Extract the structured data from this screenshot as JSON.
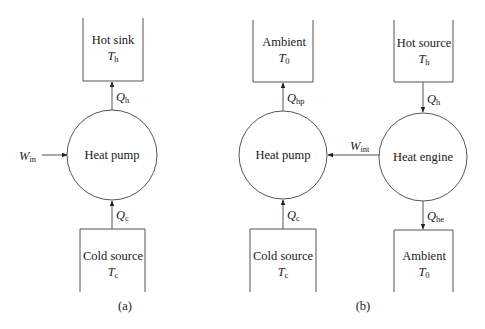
{
  "diagram_a": {
    "caption": "(a)",
    "hot_sink": {
      "name": "Hot sink",
      "temp_sym": "T",
      "temp_sub": "h"
    },
    "heat_pump": {
      "name": "Heat pump"
    },
    "cold_source": {
      "name": "Cold source",
      "temp_sym": "T",
      "temp_sub": "c"
    },
    "q_hot": {
      "sym": "Q",
      "sub": "h"
    },
    "q_cold": {
      "sym": "Q",
      "sub": "c"
    },
    "work_in": {
      "sym": "W",
      "sub": "in"
    }
  },
  "diagram_b": {
    "caption": "(b)",
    "ambient_top": {
      "name": "Ambient",
      "temp_sym": "T",
      "temp_sub": "0"
    },
    "heat_pump": {
      "name": "Heat pump"
    },
    "cold_source": {
      "name": "Cold source",
      "temp_sym": "T",
      "temp_sub": "c"
    },
    "hot_source": {
      "name": "Hot source",
      "temp_sym": "T",
      "temp_sub": "h"
    },
    "heat_engine": {
      "name": "Heat engine"
    },
    "ambient_bottom": {
      "name": "Ambient",
      "temp_sym": "T",
      "temp_sub": "0"
    },
    "q_hp": {
      "sym": "Q",
      "sub": "hp"
    },
    "q_c": {
      "sym": "Q",
      "sub": "c"
    },
    "q_h": {
      "sym": "Q",
      "sub": "h"
    },
    "q_he": {
      "sym": "Q",
      "sub": "he"
    },
    "work_int": {
      "sym": "W",
      "sub": "int"
    }
  }
}
